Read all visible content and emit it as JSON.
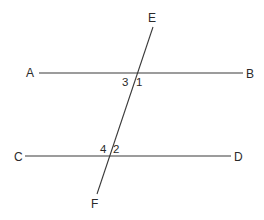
{
  "diagram": {
    "type": "parallel lines cut by transversal",
    "points": {
      "A": "A",
      "B": "B",
      "C": "C",
      "D": "D",
      "E": "E",
      "F": "F"
    },
    "angles": {
      "a1": "1",
      "a2": "2",
      "a3": "3",
      "a4": "4"
    },
    "lines": [
      {
        "name": "AB",
        "from": "A",
        "to": "B"
      },
      {
        "name": "CD",
        "from": "C",
        "to": "D"
      },
      {
        "name": "EF",
        "from": "E",
        "to": "F"
      }
    ],
    "colors": {
      "line": "#3a3a3a",
      "text": "#2a2a2a",
      "background": "#ffffff"
    }
  }
}
